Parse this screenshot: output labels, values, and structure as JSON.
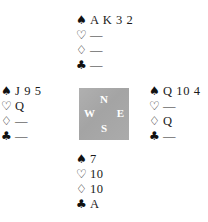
{
  "diagram": {
    "suit_symbols": {
      "spade": "♠",
      "heart": "♡",
      "diamond": "♢",
      "club": "♣"
    },
    "void_mark": "—",
    "compass": {
      "north": "N",
      "west": "W",
      "east": "E",
      "south": "S",
      "box_color": "#a9a9a9",
      "letter_color": "#ffffff"
    },
    "hands": {
      "north": {
        "label": "North",
        "spades": "A K 3 2",
        "hearts": "—",
        "diamonds": "—",
        "clubs": "—"
      },
      "west": {
        "label": "West",
        "spades": "J 9 5",
        "hearts": "Q",
        "diamonds": "—",
        "clubs": "—"
      },
      "east": {
        "label": "East",
        "spades": "Q 10 4",
        "hearts": "—",
        "diamonds": "Q",
        "clubs": "—"
      },
      "south": {
        "label": "South",
        "spades": "7",
        "hearts": "10",
        "diamonds": "10",
        "clubs": "A"
      }
    }
  }
}
